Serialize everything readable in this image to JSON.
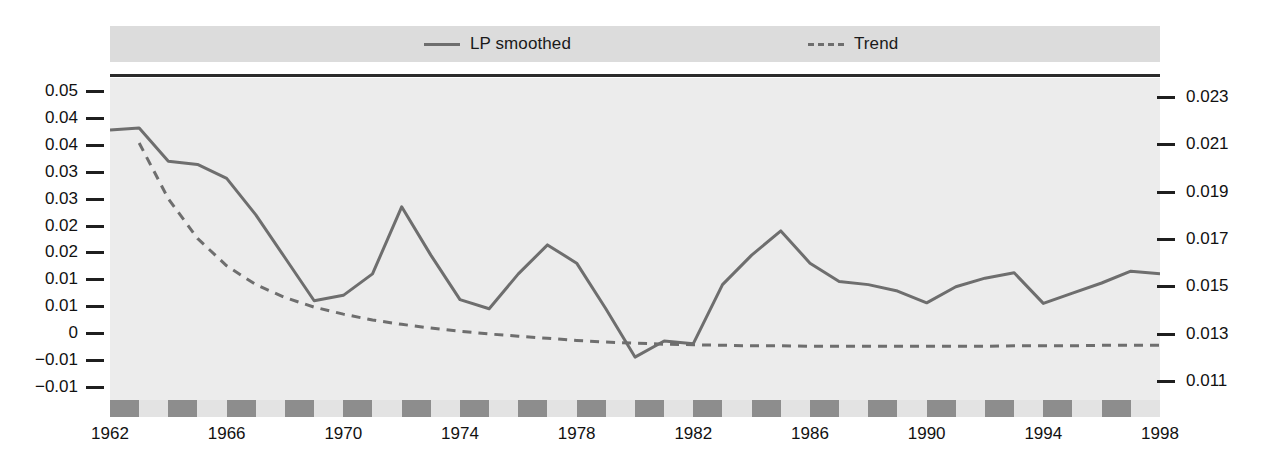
{
  "chart_data": {
    "type": "line",
    "title": "",
    "xlabel": "",
    "ylabel": "",
    "grid": false,
    "legend_position": "top",
    "x": [
      1962,
      1963,
      1964,
      1965,
      1966,
      1967,
      1968,
      1969,
      1970,
      1971,
      1972,
      1973,
      1974,
      1975,
      1976,
      1977,
      1978,
      1979,
      1980,
      1981,
      1982,
      1983,
      1984,
      1985,
      1986,
      1987,
      1988,
      1989,
      1990,
      1991,
      1992,
      1993,
      1994,
      1995,
      1996,
      1997,
      1998
    ],
    "left_axis": {
      "ticks": [
        "0.05",
        "0.04",
        "0.04",
        "0.03",
        "0.03",
        "0.02",
        "0.02",
        "0.01",
        "0.01",
        "0",
        "-0.01",
        "-0.01"
      ],
      "tick_values": [
        0.05,
        0.045,
        0.04,
        0.035,
        0.03,
        0.025,
        0.02,
        0.015,
        0.01,
        0.005,
        0.0,
        -0.005
      ],
      "ylim": [
        -0.0075,
        0.0525
      ]
    },
    "right_axis": {
      "ticks": [
        "0.023",
        "0.021",
        "0.019",
        "0.017",
        "0.015",
        "0.013",
        "0.011"
      ],
      "tick_values": [
        0.023,
        0.021,
        0.019,
        0.017,
        0.015,
        0.013,
        0.011
      ],
      "ylim": [
        0.0102,
        0.0238
      ]
    },
    "xticks": [
      "1962",
      "1966",
      "1970",
      "1974",
      "1978",
      "1982",
      "1986",
      "1990",
      "1994",
      "1998"
    ],
    "xtick_values": [
      1962,
      1966,
      1970,
      1974,
      1978,
      1982,
      1986,
      1990,
      1994,
      1998
    ],
    "xlim": [
      1962,
      1998
    ],
    "series": [
      {
        "name": "LP smoothed",
        "axis": "left",
        "style": "solid",
        "color": "#6e6e6e",
        "values": [
          0.0428,
          0.0432,
          0.037,
          0.0364,
          0.0338,
          0.027,
          0.019,
          0.011,
          0.012,
          0.016,
          0.0285,
          0.0195,
          0.0112,
          0.0095,
          0.016,
          0.0214,
          0.018,
          0.0095,
          0.0005,
          0.0035,
          0.003,
          0.014,
          0.0195,
          0.024,
          0.018,
          0.0146,
          0.014,
          0.0128,
          0.0106,
          0.0136,
          0.0152,
          0.0162,
          0.0105,
          0.0124,
          0.0143,
          0.0165,
          0.016
        ]
      },
      {
        "name": "Trend",
        "axis": "left",
        "style": "dashed",
        "color": "#6e6e6e",
        "values": [
          null,
          0.0404,
          0.03,
          0.0226,
          0.0175,
          0.014,
          0.0116,
          0.0098,
          0.0085,
          0.0074,
          0.0066,
          0.0059,
          0.0053,
          0.0048,
          0.0044,
          0.004,
          0.0036,
          0.0033,
          0.0031,
          0.0029,
          0.0028,
          0.0027,
          0.0026,
          0.0026,
          0.0025,
          0.0025,
          0.0025,
          0.0025,
          0.0025,
          0.0025,
          0.0025,
          0.0026,
          0.0026,
          0.0026,
          0.0027,
          0.0027,
          0.0027
        ]
      }
    ],
    "legend": [
      {
        "label": "LP smoothed",
        "style": "solid"
      },
      {
        "label": "Trend",
        "style": "dashed"
      }
    ],
    "colors": {
      "plot_background": "#ececec",
      "legend_background": "#dcdcdc",
      "line": "#6e6e6e",
      "axis": "#1f1f1f",
      "band_dark": "#8d8d8d",
      "band_light": "#e3e3e3"
    }
  }
}
